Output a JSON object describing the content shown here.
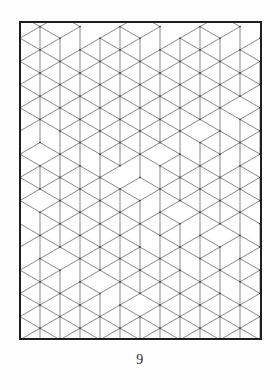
{
  "page": {
    "number_label": "9",
    "background_color": "#fefefe",
    "ink_color": "#3a3a3a",
    "frame_color": "#1e1e1e"
  },
  "plate": {
    "title": "",
    "kind": "isometric-cube-tessellation",
    "frame": {
      "x": 19,
      "y": 21,
      "width": 243,
      "height": 319,
      "stroke_width": 2
    },
    "line_color": "#555555",
    "line_width": 0.7,
    "vertex_dot_color": "#2f2f2f",
    "vertex_dot_radius": 0.75,
    "geometry": {
      "half_width": 20,
      "quarter_height": 11.6,
      "origin_x": 1,
      "origin_y": -6
    },
    "cubes": [
      {
        "c": 0,
        "r": 0
      },
      {
        "c": 0,
        "r": 2
      },
      {
        "c": 0,
        "r": 6
      },
      {
        "c": 0,
        "r": 8
      },
      {
        "c": 0,
        "r": 12
      },
      {
        "c": 0,
        "r": 18
      },
      {
        "c": 0,
        "r": 22
      },
      {
        "c": 0,
        "r": 26
      },
      {
        "c": 1,
        "r": 1
      },
      {
        "c": 1,
        "r": 5
      },
      {
        "c": 1,
        "r": 11
      },
      {
        "c": 1,
        "r": 15
      },
      {
        "c": 1,
        "r": 21
      },
      {
        "c": 1,
        "r": 25
      },
      {
        "c": 2,
        "r": 0
      },
      {
        "c": 2,
        "r": 4
      },
      {
        "c": 2,
        "r": 8
      },
      {
        "c": 2,
        "r": 12
      },
      {
        "c": 2,
        "r": 16
      },
      {
        "c": 2,
        "r": 20
      },
      {
        "c": 2,
        "r": 24
      },
      {
        "c": 3,
        "r": 3
      },
      {
        "c": 3,
        "r": 7
      },
      {
        "c": 3,
        "r": 13
      },
      {
        "c": 3,
        "r": 17
      },
      {
        "c": 3,
        "r": 23
      },
      {
        "c": 4,
        "r": 2
      },
      {
        "c": 4,
        "r": 6
      },
      {
        "c": 4,
        "r": 10
      },
      {
        "c": 4,
        "r": 14
      },
      {
        "c": 4,
        "r": 18
      },
      {
        "c": 4,
        "r": 22
      },
      {
        "c": 4,
        "r": 26
      },
      {
        "c": 5,
        "r": 1
      },
      {
        "c": 5,
        "r": 5
      },
      {
        "c": 5,
        "r": 9
      },
      {
        "c": 5,
        "r": 15
      },
      {
        "c": 5,
        "r": 19
      },
      {
        "c": 5,
        "r": 25
      },
      {
        "c": 6,
        "r": 0
      },
      {
        "c": 6,
        "r": 4
      },
      {
        "c": 6,
        "r": 8
      },
      {
        "c": 6,
        "r": 14
      },
      {
        "c": 6,
        "r": 20
      },
      {
        "c": 6,
        "r": 24
      },
      {
        "c": 7,
        "r": 3
      },
      {
        "c": 7,
        "r": 7
      },
      {
        "c": 7,
        "r": 11
      },
      {
        "c": 7,
        "r": 17
      },
      {
        "c": 7,
        "r": 21
      },
      {
        "c": 7,
        "r": 25
      },
      {
        "c": 8,
        "r": 2
      },
      {
        "c": 8,
        "r": 6
      },
      {
        "c": 8,
        "r": 12
      },
      {
        "c": 8,
        "r": 16
      },
      {
        "c": 8,
        "r": 22
      },
      {
        "c": 8,
        "r": 26
      },
      {
        "c": 9,
        "r": 1
      },
      {
        "c": 9,
        "r": 5
      },
      {
        "c": 9,
        "r": 9
      },
      {
        "c": 9,
        "r": 13
      },
      {
        "c": 9,
        "r": 19
      },
      {
        "c": 9,
        "r": 23
      },
      {
        "c": 10,
        "r": 0
      },
      {
        "c": 10,
        "r": 4
      },
      {
        "c": 10,
        "r": 10
      },
      {
        "c": 10,
        "r": 14
      },
      {
        "c": 10,
        "r": 18
      },
      {
        "c": 10,
        "r": 24
      },
      {
        "c": 11,
        "r": 3
      },
      {
        "c": 11,
        "r": 7
      },
      {
        "c": 11,
        "r": 13
      },
      {
        "c": 11,
        "r": 21
      },
      {
        "c": 11,
        "r": 25
      },
      {
        "c": 12,
        "r": 2
      },
      {
        "c": 12,
        "r": 8
      },
      {
        "c": 12,
        "r": 12
      },
      {
        "c": 12,
        "r": 16
      },
      {
        "c": 12,
        "r": 20
      },
      {
        "c": 12,
        "r": 26
      }
    ]
  }
}
